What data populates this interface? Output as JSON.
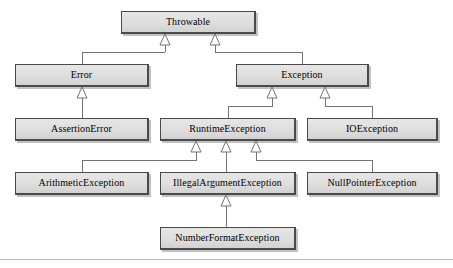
{
  "diagram": {
    "type": "uml-class-inheritance",
    "style": {
      "box_fill": "#dedede",
      "box_border": "#4a4a4a",
      "connector_color": "#707070",
      "arrowhead": "hollow-triangle",
      "text_color": "#000000",
      "background": "#ffffff",
      "rule_color": "#b8b8b8"
    },
    "nodes": [
      {
        "id": "throwable",
        "label": "Throwable",
        "x": 121,
        "y": 11,
        "w": 135,
        "h": 23
      },
      {
        "id": "error",
        "label": "Error",
        "x": 15,
        "y": 64,
        "w": 134,
        "h": 23
      },
      {
        "id": "exception",
        "label": "Exception",
        "x": 236,
        "y": 64,
        "w": 133,
        "h": 23
      },
      {
        "id": "assertion-error",
        "label": "AssertionError",
        "x": 15,
        "y": 118,
        "w": 134,
        "h": 23
      },
      {
        "id": "runtime-exception",
        "label": "RuntimeException",
        "x": 160,
        "y": 118,
        "w": 136,
        "h": 23
      },
      {
        "id": "io-exception",
        "label": "IOException",
        "x": 307,
        "y": 118,
        "w": 131,
        "h": 23
      },
      {
        "id": "arithmetic-exception",
        "label": "ArithmeticException",
        "x": 15,
        "y": 172,
        "w": 134,
        "h": 23
      },
      {
        "id": "illegal-argument-exception",
        "label": "IllegalArgumentException",
        "x": 160,
        "y": 172,
        "w": 136,
        "h": 23
      },
      {
        "id": "null-pointer-exception",
        "label": "NullPointerException",
        "x": 307,
        "y": 172,
        "w": 131,
        "h": 23
      },
      {
        "id": "number-format-exception",
        "label": "NumberFormatException",
        "x": 160,
        "y": 227,
        "w": 136,
        "h": 23
      }
    ],
    "edges": [
      {
        "from": "error",
        "to": "throwable",
        "relation": "extends"
      },
      {
        "from": "exception",
        "to": "throwable",
        "relation": "extends"
      },
      {
        "from": "assertion-error",
        "to": "error",
        "relation": "extends"
      },
      {
        "from": "runtime-exception",
        "to": "exception",
        "relation": "extends"
      },
      {
        "from": "io-exception",
        "to": "exception",
        "relation": "extends"
      },
      {
        "from": "arithmetic-exception",
        "to": "runtime-exception",
        "relation": "extends"
      },
      {
        "from": "illegal-argument-exception",
        "to": "runtime-exception",
        "relation": "extends"
      },
      {
        "from": "null-pointer-exception",
        "to": "runtime-exception",
        "relation": "extends"
      },
      {
        "from": "number-format-exception",
        "to": "illegal-argument-exception",
        "relation": "extends"
      }
    ]
  }
}
